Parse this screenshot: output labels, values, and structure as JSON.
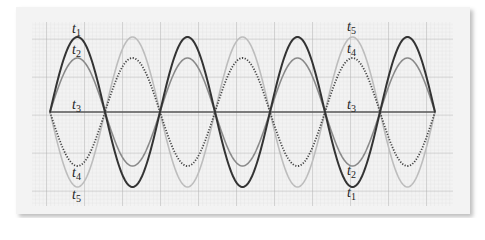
{
  "figure": {
    "labels_left": [
      {
        "id": "t1",
        "text": "t",
        "sub": "1",
        "x": 72,
        "y": 22
      },
      {
        "id": "t2",
        "text": "t",
        "sub": "2",
        "x": 72,
        "y": 43
      },
      {
        "id": "t3",
        "text": "t",
        "sub": "3",
        "x": 72,
        "y": 98
      },
      {
        "id": "t4",
        "text": "t",
        "sub": "4",
        "x": 72,
        "y": 166
      },
      {
        "id": "t5",
        "text": "t",
        "sub": "5",
        "x": 72,
        "y": 188
      }
    ],
    "labels_right": [
      {
        "id": "t5",
        "text": "t",
        "sub": "5",
        "x": 347,
        "y": 20
      },
      {
        "id": "t4",
        "text": "t",
        "sub": "4",
        "x": 347,
        "y": 42
      },
      {
        "id": "t3",
        "text": "t",
        "sub": "3",
        "x": 347,
        "y": 98
      },
      {
        "id": "t2",
        "text": "t",
        "sub": "2",
        "x": 347,
        "y": 164
      },
      {
        "id": "t1",
        "text": "t",
        "sub": "1",
        "x": 347,
        "y": 186
      }
    ]
  },
  "chart_data": {
    "type": "line",
    "title": "",
    "xlabel": "",
    "ylabel": "",
    "grid": true,
    "x_start_px": 50,
    "half_period_px": 55,
    "half_cycles": 7,
    "axis_y_px": 112,
    "series": [
      {
        "name": "t1",
        "amplitude": 1.0,
        "phase_sign": 1,
        "style": "solid",
        "color": "#333333"
      },
      {
        "name": "t2",
        "amplitude": 0.72,
        "phase_sign": 1,
        "style": "solid",
        "color": "#8a8a8a"
      },
      {
        "name": "t3",
        "amplitude": 0.0,
        "phase_sign": 1,
        "style": "solid",
        "color": "#555555"
      },
      {
        "name": "t4",
        "amplitude": 0.72,
        "phase_sign": -1,
        "style": "dotted",
        "color": "#444444"
      },
      {
        "name": "t5",
        "amplitude": 1.0,
        "phase_sign": -1,
        "style": "solid",
        "color": "#bdbdbd"
      }
    ],
    "amplitude_px": 75,
    "colors": {
      "card": "#f3f3f3",
      "minor_grid": "#d6d6d6",
      "major_grid": "#a8a8a8"
    }
  }
}
